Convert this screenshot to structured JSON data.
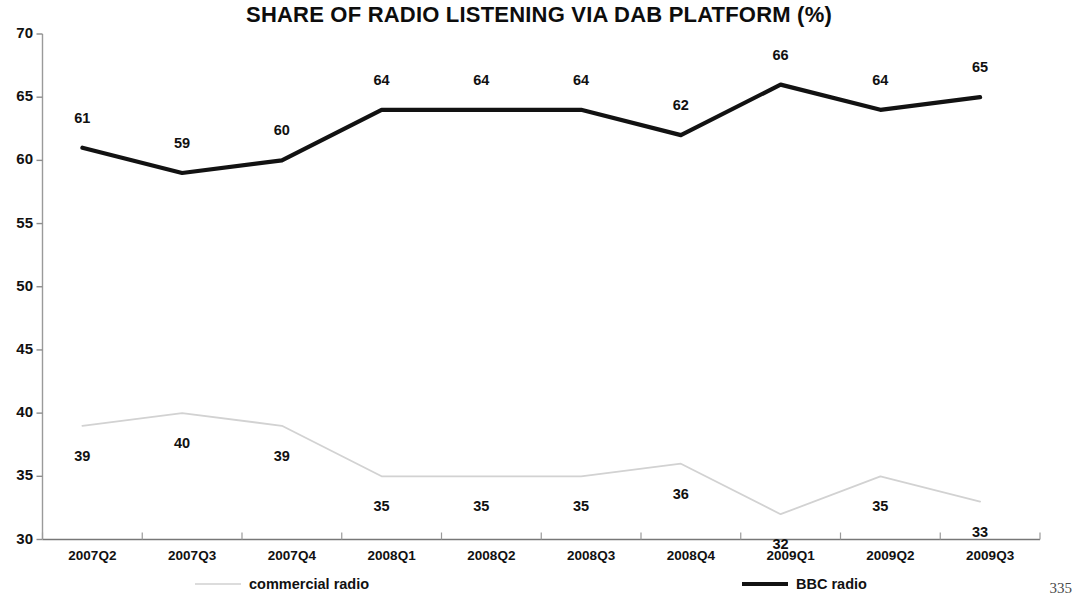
{
  "page": {
    "page_number": "335"
  },
  "chart_data": {
    "type": "line",
    "title": "SHARE OF RADIO LISTENING VIA DAB PLATFORM (%)",
    "xlabel": "",
    "ylabel": "",
    "ylim": [
      30,
      70
    ],
    "ytick_step": 5,
    "yticks": [
      "30",
      "35",
      "40",
      "45",
      "50",
      "55",
      "60",
      "65",
      "70"
    ],
    "grid": false,
    "legend_position": "bottom",
    "categories": [
      "2007Q2",
      "2007Q3",
      "2007Q4",
      "2008Q1",
      "2008Q2",
      "2008Q3",
      "2008Q4",
      "2009Q1",
      "2009Q2",
      "2009Q3"
    ],
    "series": [
      {
        "name": "commercial radio",
        "color": "#d2d2d2",
        "values": [
          39,
          40,
          39,
          35,
          35,
          35,
          36,
          32,
          35,
          33
        ],
        "label_positions": [
          "below",
          "below",
          "below",
          "below",
          "below",
          "below",
          "below",
          "below",
          "below",
          "below"
        ]
      },
      {
        "name": "BBC radio",
        "color": "#121212",
        "values": [
          61,
          59,
          60,
          64,
          64,
          64,
          62,
          66,
          64,
          65
        ],
        "label_positions": [
          "above",
          "above",
          "above",
          "above",
          "above",
          "above",
          "above",
          "above",
          "above",
          "above"
        ]
      }
    ]
  }
}
